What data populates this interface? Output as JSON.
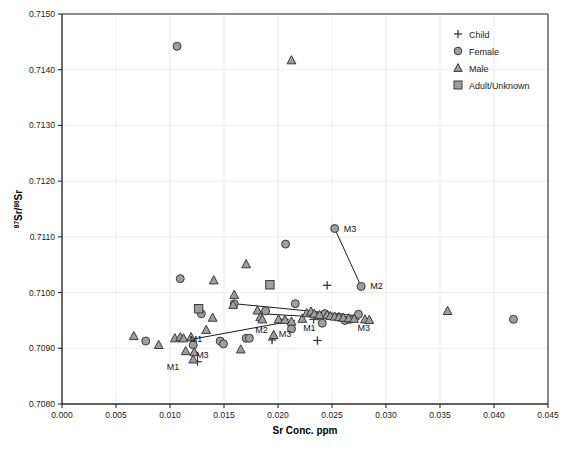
{
  "chart_data": {
    "type": "scatter",
    "title": "",
    "xlabel": "Sr Conc. ppm",
    "ylabel": "87Sr/86Sr",
    "ylabel_parts": {
      "sup1": "87",
      "mid": "Sr/",
      "sup2": "86",
      "end": "Sr"
    },
    "xlim": [
      0.0,
      0.045
    ],
    "ylim": [
      0.708,
      0.715
    ],
    "xticks": [
      "0.000",
      "0.005",
      "0.010",
      "0.015",
      "0.020",
      "0.025",
      "0.030",
      "0.035",
      "0.040",
      "0.045"
    ],
    "xtick_values": [
      0.0,
      0.005,
      0.01,
      0.015,
      0.02,
      0.025,
      0.03,
      0.035,
      0.04,
      0.045
    ],
    "yticks": [
      "0.7080",
      "0.7090",
      "0.7100",
      "0.7110",
      "0.7120",
      "0.7130",
      "0.7140",
      "0.7150"
    ],
    "ytick_values": [
      0.708,
      0.709,
      0.71,
      0.711,
      0.712,
      0.713,
      0.714,
      0.715
    ],
    "grid": true,
    "legend_position": "top-right",
    "legend": [
      {
        "label": "Child",
        "marker": "plus"
      },
      {
        "label": "Female",
        "marker": "circle"
      },
      {
        "label": "Male",
        "marker": "triangle"
      },
      {
        "label": "Adult/Unknown",
        "marker": "square"
      }
    ],
    "series": [
      {
        "name": "Child",
        "marker": "plus",
        "points": [
          {
            "x": 0.01255,
            "y": 0.70876
          },
          {
            "x": 0.01945,
            "y": 0.70915
          },
          {
            "x": 0.0206,
            "y": 0.70952
          },
          {
            "x": 0.0233,
            "y": 0.70952
          },
          {
            "x": 0.02365,
            "y": 0.70914
          },
          {
            "x": 0.02455,
            "y": 0.71013
          },
          {
            "x": 0.02425,
            "y": 0.70962
          }
        ]
      },
      {
        "name": "Female",
        "marker": "circle",
        "points": [
          {
            "x": 0.01065,
            "y": 0.71442
          },
          {
            "x": 0.01095,
            "y": 0.71025
          },
          {
            "x": 0.00775,
            "y": 0.70913
          },
          {
            "x": 0.01215,
            "y": 0.70906
          },
          {
            "x": 0.0129,
            "y": 0.70962
          },
          {
            "x": 0.01465,
            "y": 0.70913
          },
          {
            "x": 0.01495,
            "y": 0.70908
          },
          {
            "x": 0.01595,
            "y": 0.7098
          },
          {
            "x": 0.01705,
            "y": 0.70918
          },
          {
            "x": 0.01735,
            "y": 0.70918
          },
          {
            "x": 0.01885,
            "y": 0.70967
          },
          {
            "x": 0.0207,
            "y": 0.71087
          },
          {
            "x": 0.02125,
            "y": 0.70935
          },
          {
            "x": 0.0216,
            "y": 0.7098
          },
          {
            "x": 0.0236,
            "y": 0.70958
          },
          {
            "x": 0.0241,
            "y": 0.70945
          },
          {
            "x": 0.02435,
            "y": 0.70962
          },
          {
            "x": 0.02525,
            "y": 0.71115
          },
          {
            "x": 0.0256,
            "y": 0.70956
          },
          {
            "x": 0.0262,
            "y": 0.7095
          },
          {
            "x": 0.02665,
            "y": 0.70952
          },
          {
            "x": 0.02745,
            "y": 0.70961
          },
          {
            "x": 0.0277,
            "y": 0.71011
          },
          {
            "x": 0.0418,
            "y": 0.70952
          }
        ]
      },
      {
        "name": "Male",
        "marker": "triangle",
        "points": [
          {
            "x": 0.00665,
            "y": 0.70922
          },
          {
            "x": 0.00895,
            "y": 0.70906
          },
          {
            "x": 0.01045,
            "y": 0.70918
          },
          {
            "x": 0.01095,
            "y": 0.7092
          },
          {
            "x": 0.01125,
            "y": 0.70918
          },
          {
            "x": 0.01145,
            "y": 0.70895
          },
          {
            "x": 0.01195,
            "y": 0.7092
          },
          {
            "x": 0.01225,
            "y": 0.70893
          },
          {
            "x": 0.01215,
            "y": 0.7088
          },
          {
            "x": 0.01335,
            "y": 0.70933
          },
          {
            "x": 0.01405,
            "y": 0.71022
          },
          {
            "x": 0.01395,
            "y": 0.70955
          },
          {
            "x": 0.01655,
            "y": 0.70898
          },
          {
            "x": 0.01595,
            "y": 0.70996
          },
          {
            "x": 0.01585,
            "y": 0.70978
          },
          {
            "x": 0.01705,
            "y": 0.71051
          },
          {
            "x": 0.0181,
            "y": 0.70968
          },
          {
            "x": 0.01835,
            "y": 0.70956
          },
          {
            "x": 0.01855,
            "y": 0.70952
          },
          {
            "x": 0.0196,
            "y": 0.70924
          },
          {
            "x": 0.02005,
            "y": 0.70952
          },
          {
            "x": 0.02065,
            "y": 0.70951
          },
          {
            "x": 0.02125,
            "y": 0.70948
          },
          {
            "x": 0.02125,
            "y": 0.71417
          },
          {
            "x": 0.02225,
            "y": 0.70953
          },
          {
            "x": 0.02265,
            "y": 0.70963
          },
          {
            "x": 0.02305,
            "y": 0.70966
          },
          {
            "x": 0.02335,
            "y": 0.70962
          },
          {
            "x": 0.02385,
            "y": 0.7096
          },
          {
            "x": 0.02455,
            "y": 0.7096
          },
          {
            "x": 0.02485,
            "y": 0.70958
          },
          {
            "x": 0.02525,
            "y": 0.70957
          },
          {
            "x": 0.02565,
            "y": 0.70956
          },
          {
            "x": 0.02605,
            "y": 0.70955
          },
          {
            "x": 0.02655,
            "y": 0.70954
          },
          {
            "x": 0.02705,
            "y": 0.70953
          },
          {
            "x": 0.02805,
            "y": 0.70952
          },
          {
            "x": 0.02845,
            "y": 0.70951
          },
          {
            "x": 0.0357,
            "y": 0.70967
          }
        ]
      },
      {
        "name": "Adult/Unknown",
        "marker": "square",
        "points": [
          {
            "x": 0.01265,
            "y": 0.70971
          },
          {
            "x": 0.01925,
            "y": 0.71014
          }
        ]
      }
    ],
    "annotations": [
      {
        "text": "M3",
        "x": 0.02525,
        "y": 0.71115,
        "dx": 9,
        "dy": 3
      },
      {
        "text": "M2",
        "x": 0.0277,
        "y": 0.71011,
        "dx": 9,
        "dy": 3
      },
      {
        "text": "M1",
        "x": 0.01155,
        "y": 0.70917,
        "dx": 3,
        "dy": 3
      },
      {
        "text": "M3",
        "x": 0.01205,
        "y": 0.70893,
        "dx": 4,
        "dy": 6
      },
      {
        "text": "M1",
        "x": 0.01035,
        "y": 0.70877,
        "dx": -7,
        "dy": 9
      },
      {
        "text": "M2",
        "x": 0.01835,
        "y": 0.70947,
        "dx": -5,
        "dy": 11
      },
      {
        "text": "M3",
        "x": 0.02035,
        "y": 0.70924,
        "dx": -3,
        "dy": 2
      },
      {
        "text": "M1",
        "x": 0.02205,
        "y": 0.7094,
        "dx": 3,
        "dy": 5
      },
      {
        "text": "M3",
        "x": 0.02755,
        "y": 0.7094,
        "dx": -2,
        "dy": 5
      }
    ],
    "connector_lines": [
      {
        "name": "m3-m2-link",
        "from": {
          "x": 0.02525,
          "y": 0.71115
        },
        "to": {
          "x": 0.0277,
          "y": 0.71011
        }
      },
      {
        "name": "upper-trend",
        "from": {
          "x": 0.01595,
          "y": 0.7098
        },
        "to": {
          "x": 0.02755,
          "y": 0.70958
        }
      },
      {
        "name": "mid-trend",
        "from": {
          "x": 0.01835,
          "y": 0.70962
        },
        "to": {
          "x": 0.02755,
          "y": 0.70952
        }
      },
      {
        "name": "lower-trend",
        "from": {
          "x": 0.01115,
          "y": 0.70913
        },
        "to": {
          "x": 0.02155,
          "y": 0.7095
        }
      }
    ],
    "colors": {
      "marker_fill": "#9e9e9e",
      "marker_stroke": "#3a3a3a",
      "axis": "#2b2b2b",
      "grid": "#e8e8e8",
      "text": "#1a1a1a",
      "line": "#1a1a1a"
    }
  }
}
